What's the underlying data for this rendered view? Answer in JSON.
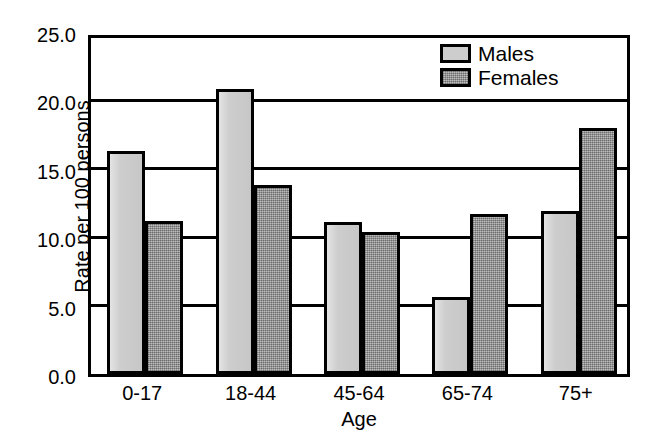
{
  "chart_data": {
    "type": "bar",
    "title": "",
    "subtitle": "",
    "xlabel": "Age",
    "ylabel": "Rate per 100 persons",
    "categories": [
      "0-17",
      "18-44",
      "45-64",
      "65-74",
      "75+"
    ],
    "series": [
      {
        "name": "Males",
        "color": "#cdcdcd",
        "values": [
          16.3,
          20.8,
          11.1,
          5.6,
          11.9
        ]
      },
      {
        "name": "Females",
        "color": "#9b9b9b",
        "values": [
          11.2,
          13.8,
          10.4,
          11.7,
          18.0
        ]
      }
    ],
    "ylim": [
      0.0,
      25.0
    ],
    "yticks": [
      "0.0",
      "5.0",
      "10.0",
      "15.0",
      "20.0",
      "25.0"
    ],
    "ytick_values": [
      0.0,
      5.0,
      10.0,
      15.0,
      20.0,
      25.0
    ],
    "grid": true,
    "grid_axis": "y",
    "legend": [
      "Males",
      "Females"
    ],
    "legend_position": "top-right"
  },
  "colors": {
    "axis": "#000000",
    "background": "#ffffff",
    "males": "#cdcdcd",
    "females": "#9b9b9b"
  }
}
